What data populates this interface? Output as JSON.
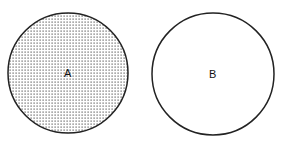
{
  "diagram": {
    "circles": [
      {
        "label": "A",
        "fill": "dotted",
        "cx": 68,
        "cy": 73,
        "r": 60
      },
      {
        "label": "B",
        "fill": "none",
        "cx": 213,
        "cy": 74,
        "r": 61
      }
    ],
    "colors": {
      "stroke": "#222222",
      "dot": "#555555",
      "background": "#ffffff"
    }
  }
}
